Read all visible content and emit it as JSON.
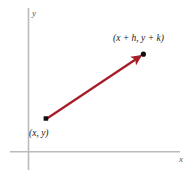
{
  "figure": {
    "type": "vector-diagram",
    "background_color": "#ffffff",
    "axes": {
      "color": "#b9bbbd",
      "x_label": "x",
      "y_label": "y",
      "origin": [
        28,
        152
      ],
      "x_axis_extent": [
        10,
        180
      ],
      "y_axis_extent": [
        8,
        170
      ]
    },
    "vector": {
      "color": "#a51f28",
      "start_point": {
        "label": "(x, y)",
        "coords": [
          46,
          119
        ]
      },
      "end_point": {
        "label": "(x + h, y + k)",
        "coords": [
          143,
          54
        ]
      },
      "arrowhead": "at-end",
      "marker_color": "#111111"
    }
  }
}
